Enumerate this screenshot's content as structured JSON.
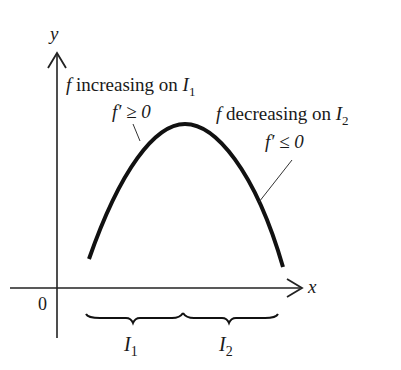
{
  "diagram": {
    "axes": {
      "x_label": "x",
      "y_label": "y",
      "origin_label": "0"
    },
    "curve": {
      "description": "concave-down arch, increasing then decreasing",
      "color": "#111111"
    },
    "annotations": {
      "increasing": {
        "f": "f",
        "text": " increasing on ",
        "interval": "I",
        "sub": "1"
      },
      "increasing_derivative": {
        "text": "f′ ≥ 0"
      },
      "decreasing": {
        "f": "f",
        "text": " decreasing on ",
        "interval": "I",
        "sub": "2"
      },
      "decreasing_derivative": {
        "text": "f′ ≤ 0"
      }
    },
    "intervals": [
      {
        "label": "I",
        "sub": "1"
      },
      {
        "label": "I",
        "sub": "2"
      }
    ]
  }
}
